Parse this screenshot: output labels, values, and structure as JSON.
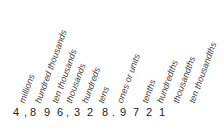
{
  "place_values": [
    {
      "label": "millions",
      "x": 17,
      "y": 101
    },
    {
      "label": "hundred thousands",
      "x": 33,
      "y": 101
    },
    {
      "label": "ten thousands",
      "x": 50,
      "y": 101
    },
    {
      "label": "thousands",
      "x": 64,
      "y": 101
    },
    {
      "label": "hundreds",
      "x": 80,
      "y": 101
    },
    {
      "label": "tens",
      "x": 96,
      "y": 101
    },
    {
      "label": "ones or units",
      "x": 115,
      "y": 101
    },
    {
      "label": "tenths",
      "x": 140,
      "y": 101
    },
    {
      "label": "hundredths",
      "x": 155,
      "y": 101
    },
    {
      "label": "thousandths",
      "x": 171,
      "y": 101
    },
    {
      "label": "ten thousandths",
      "x": 187,
      "y": 101
    }
  ],
  "number": {
    "digits": [
      {
        "ch": "4",
        "x": 13
      },
      {
        "ch": ",",
        "x": 24
      },
      {
        "ch": "8",
        "x": 30
      },
      {
        "ch": "9",
        "x": 44
      },
      {
        "ch": "6",
        "x": 57
      },
      {
        "ch": ",",
        "x": 66
      },
      {
        "ch": "3",
        "x": 74
      },
      {
        "ch": "2",
        "x": 87
      },
      {
        "ch": "8",
        "x": 102
      },
      {
        "ch": ".",
        "x": 112
      },
      {
        "ch": "9",
        "x": 120
      },
      {
        "ch": "7",
        "x": 133
      },
      {
        "ch": "2",
        "x": 146
      },
      {
        "ch": "1",
        "x": 159
      }
    ],
    "full": "4,896,328.9721"
  }
}
